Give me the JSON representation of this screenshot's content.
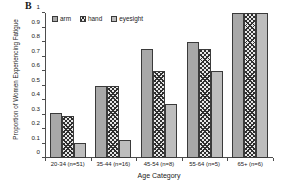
{
  "panel_label": "B",
  "chart_data": {
    "type": "bar",
    "title": "",
    "xlabel": "Age Category",
    "ylabel": "Proportion of Women Experiencing Fatigue",
    "ylim": [
      0,
      1
    ],
    "ytick_labels": [
      "1",
      "0.9",
      "0.8",
      "0.7",
      "0.6",
      "0.5",
      "0.4",
      "0.3",
      "0.2",
      "0.1",
      "0"
    ],
    "ytick_values": [
      1,
      0.9,
      0.8,
      0.7,
      0.6,
      0.5,
      0.4,
      0.3,
      0.2,
      0.1,
      0
    ],
    "grid": false,
    "legend_position": "top-left-inside",
    "categories": [
      "20-34 (n=51)",
      "35-44 (n=16)",
      "45-54 (n=8)",
      "55-64 (n=5)",
      "65+ (n=6)"
    ],
    "series": [
      {
        "name": "arm",
        "pattern": "solid-gray",
        "values": [
          0.31,
          0.5,
          0.75,
          0.8,
          1.0
        ]
      },
      {
        "name": "hand",
        "pattern": "crosshatch",
        "values": [
          0.29,
          0.5,
          0.6,
          0.75,
          1.0
        ]
      },
      {
        "name": "eyesight",
        "pattern": "dotted",
        "values": [
          0.105,
          0.125,
          0.375,
          0.6,
          1.0
        ]
      }
    ]
  }
}
